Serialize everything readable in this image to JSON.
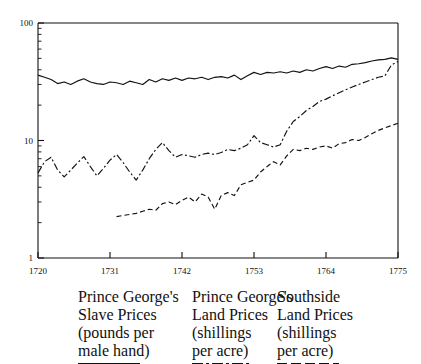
{
  "chart_data": {
    "type": "line",
    "title": "",
    "xlabel": "",
    "ylabel": "",
    "yscale": "log",
    "ylim": [
      1,
      100
    ],
    "xlim": [
      1720,
      1775
    ],
    "grid": false,
    "legend_position": "below-axes",
    "y_ticks": [
      "1",
      "10",
      "100"
    ],
    "y_tick_values": [
      1,
      10,
      100
    ],
    "x_ticks": [
      "1720",
      "1731",
      "1742",
      "1753",
      "1764",
      "1775"
    ],
    "x_tick_values": [
      1720,
      1731,
      1742,
      1753,
      1764,
      1775
    ],
    "series": [
      {
        "name": "Prince George's Slave Prices (pounds per male hand)",
        "short_name": "Prince George's Slave Prices",
        "units": "pounds per male hand",
        "style": "solid",
        "x": [
          1720,
          1721,
          1722,
          1723,
          1724,
          1725,
          1726,
          1727,
          1728,
          1729,
          1730,
          1731,
          1732,
          1733,
          1734,
          1735,
          1736,
          1737,
          1738,
          1739,
          1740,
          1741,
          1742,
          1743,
          1744,
          1745,
          1746,
          1747,
          1748,
          1749,
          1750,
          1751,
          1752,
          1753,
          1754,
          1755,
          1756,
          1757,
          1758,
          1759,
          1760,
          1761,
          1762,
          1763,
          1764,
          1765,
          1766,
          1767,
          1768,
          1769,
          1770,
          1771,
          1772,
          1773,
          1774,
          1775
        ],
        "values": [
          36.0,
          34.5,
          33.0,
          30.5,
          31.5,
          30.0,
          32.0,
          33.5,
          31.5,
          30.5,
          30.0,
          31.5,
          31.0,
          30.0,
          32.0,
          31.0,
          30.0,
          33.0,
          31.5,
          33.5,
          32.5,
          34.0,
          32.5,
          34.0,
          33.5,
          34.5,
          33.0,
          34.5,
          35.0,
          34.0,
          36.0,
          33.0,
          35.5,
          38.0,
          36.5,
          38.0,
          37.5,
          38.5,
          37.5,
          39.0,
          38.0,
          40.0,
          39.0,
          41.0,
          42.5,
          41.0,
          43.0,
          42.0,
          44.5,
          45.0,
          46.0,
          47.5,
          48.5,
          49.0,
          50.5,
          49.0
        ]
      },
      {
        "name": "Prince George's Land Prices (shillings per acre)",
        "short_name": "Prince George's Land Prices",
        "units": "shillings per acre",
        "style": "dash-dot",
        "x": [
          1720,
          1721,
          1722,
          1723,
          1724,
          1725,
          1726,
          1727,
          1728,
          1729,
          1730,
          1731,
          1732,
          1733,
          1734,
          1735,
          1736,
          1737,
          1738,
          1739,
          1740,
          1741,
          1742,
          1743,
          1744,
          1745,
          1746,
          1747,
          1748,
          1749,
          1750,
          1751,
          1752,
          1753,
          1754,
          1755,
          1756,
          1757,
          1758,
          1759,
          1760,
          1761,
          1762,
          1763,
          1764,
          1765,
          1766,
          1767,
          1768,
          1769,
          1770,
          1771,
          1772,
          1773,
          1774,
          1775
        ],
        "values": [
          5.3,
          6.6,
          7.2,
          5.6,
          4.9,
          5.6,
          6.4,
          7.3,
          6.0,
          5.0,
          5.8,
          6.8,
          7.6,
          6.5,
          5.4,
          4.6,
          5.6,
          7.0,
          8.4,
          9.6,
          8.2,
          7.2,
          7.6,
          7.4,
          7.2,
          7.6,
          7.8,
          7.6,
          7.9,
          8.4,
          8.2,
          8.6,
          9.2,
          11.0,
          9.6,
          9.2,
          8.8,
          9.2,
          12.0,
          14.5,
          16.0,
          18.0,
          19.5,
          21.5,
          22.5,
          24.0,
          25.5,
          27.0,
          28.5,
          30.0,
          31.5,
          33.0,
          34.5,
          35.5,
          44.0,
          47.0
        ]
      },
      {
        "name": "Southside Land Prices (shillings per acre)",
        "short_name": "Southside Land Prices",
        "units": "shillings per acre",
        "style": "dashed",
        "x": [
          1732,
          1733,
          1734,
          1735,
          1736,
          1737,
          1738,
          1739,
          1740,
          1741,
          1742,
          1743,
          1744,
          1745,
          1746,
          1747,
          1748,
          1749,
          1750,
          1751,
          1752,
          1753,
          1754,
          1755,
          1756,
          1757,
          1758,
          1759,
          1760,
          1761,
          1762,
          1763,
          1764,
          1765,
          1766,
          1767,
          1768,
          1769,
          1770,
          1771,
          1772,
          1773,
          1774,
          1775
        ],
        "values": [
          2.25,
          2.3,
          2.35,
          2.4,
          2.5,
          2.6,
          2.55,
          2.9,
          3.0,
          2.85,
          3.1,
          3.3,
          3.0,
          3.5,
          3.3,
          2.6,
          3.4,
          3.6,
          3.4,
          4.2,
          4.4,
          4.6,
          5.4,
          6.0,
          6.6,
          6.2,
          7.4,
          8.4,
          8.2,
          8.6,
          8.4,
          8.8,
          9.0,
          8.6,
          9.4,
          9.6,
          10.2,
          10.0,
          10.6,
          11.4,
          12.2,
          12.8,
          13.4,
          14.0
        ]
      }
    ]
  },
  "legend": {
    "items": [
      {
        "line1": "Prince George's",
        "line2": "Slave Prices",
        "line3": "(pounds per",
        "line4": "male hand)",
        "key_style": "solid"
      },
      {
        "line1": "Prince George's",
        "line2": "Land Prices",
        "line3": "(shillings",
        "line4": "per acre)",
        "key_style": "dash-dot"
      },
      {
        "line1": "Southside",
        "line2": "Land Prices",
        "line3": "(shillings",
        "line4": "per acre)",
        "key_style": "dashed"
      }
    ]
  },
  "colors": {
    "ink": "#111111",
    "background": "#ffffff"
  }
}
